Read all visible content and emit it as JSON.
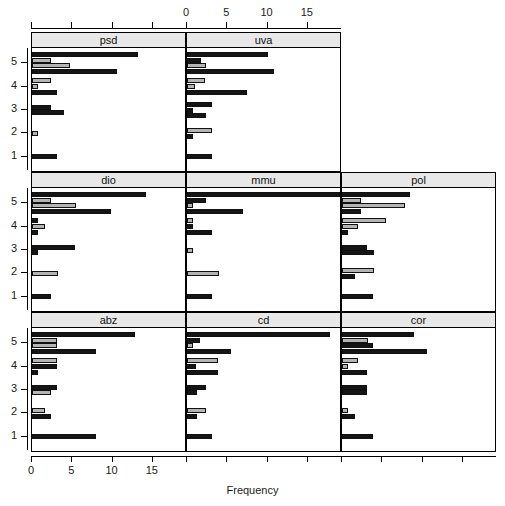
{
  "chart_data": {
    "type": "bar",
    "orientation": "horizontal",
    "title": "",
    "xlabel": "Frequency",
    "ylabel": "",
    "xlim": [
      0,
      19
    ],
    "ylim": [
      0.4,
      5.6
    ],
    "xticks": [
      0,
      5,
      10,
      15
    ],
    "yticks": [
      1,
      2,
      3,
      4,
      5
    ],
    "xtick_labels": [
      "0",
      "5",
      "10",
      "15"
    ],
    "ytick_labels": [
      "1",
      "2",
      "3",
      "4",
      "5"
    ],
    "grid": false,
    "legend": "none",
    "axis_top": true,
    "axis_bottom": true,
    "layout": {
      "rows": 3,
      "cols": 3,
      "panel_order": "by-row"
    },
    "series": [
      {
        "name": "group-a",
        "color": "#151515",
        "style": "dark"
      },
      {
        "name": "group-b",
        "color": "#b4b4b4",
        "style": "light"
      }
    ],
    "panels": [
      {
        "label": "psd",
        "row": 0,
        "col": 0,
        "categories": [
          "1",
          "2",
          "3",
          "4",
          "5"
        ],
        "groups": [
          {
            "category": "5",
            "bars": [
              {
                "series": "group-a",
                "value": 13.2
              },
              {
                "series": "group-b",
                "value": 2.4
              },
              {
                "series": "group-b",
                "value": 4.7
              },
              {
                "series": "group-a",
                "value": 10.5
              }
            ]
          },
          {
            "category": "4",
            "bars": [
              {
                "series": "group-b",
                "value": 2.4
              },
              {
                "series": "group-b",
                "value": 0.8
              },
              {
                "series": "group-a",
                "value": 3.1
              }
            ]
          },
          {
            "category": "3",
            "bars": [
              {
                "series": "group-a",
                "value": 2.3
              },
              {
                "series": "group-a",
                "value": 4.0
              }
            ]
          },
          {
            "category": "2",
            "bars": [
              {
                "series": "group-b",
                "value": 0.7
              }
            ]
          },
          {
            "category": "1",
            "bars": [
              {
                "series": "group-a",
                "value": 3.1
              }
            ]
          }
        ]
      },
      {
        "label": "uva",
        "row": 0,
        "col": 1,
        "categories": [
          "1",
          "2",
          "3",
          "4",
          "5"
        ],
        "groups": [
          {
            "category": "5",
            "bars": [
              {
                "series": "group-a",
                "value": 10.0
              },
              {
                "series": "group-a",
                "value": 1.8
              },
              {
                "series": "group-b",
                "value": 2.3
              },
              {
                "series": "group-a",
                "value": 10.8
              }
            ]
          },
          {
            "category": "4",
            "bars": [
              {
                "series": "group-b",
                "value": 2.2
              },
              {
                "series": "group-b",
                "value": 1.0
              },
              {
                "series": "group-a",
                "value": 7.5
              }
            ]
          },
          {
            "category": "3",
            "bars": [
              {
                "series": "group-a",
                "value": 3.1
              },
              {
                "series": "group-a",
                "value": 0.8
              },
              {
                "series": "group-a",
                "value": 2.3
              }
            ]
          },
          {
            "category": "2",
            "bars": [
              {
                "series": "group-b",
                "value": 3.1
              },
              {
                "series": "group-a",
                "value": 0.8
              }
            ]
          },
          {
            "category": "1",
            "bars": [
              {
                "series": "group-a",
                "value": 3.1
              }
            ]
          }
        ]
      },
      {
        "label": "dio",
        "row": 1,
        "col": 0,
        "categories": [
          "1",
          "2",
          "3",
          "4",
          "5"
        ],
        "groups": [
          {
            "category": "5",
            "bars": [
              {
                "series": "group-a",
                "value": 14.2
              },
              {
                "series": "group-b",
                "value": 2.3
              },
              {
                "series": "group-b",
                "value": 5.5
              },
              {
                "series": "group-a",
                "value": 9.8
              }
            ]
          },
          {
            "category": "4",
            "bars": [
              {
                "series": "group-a",
                "value": 0.8
              },
              {
                "series": "group-b",
                "value": 1.6
              },
              {
                "series": "group-a",
                "value": 0.8
              }
            ]
          },
          {
            "category": "3",
            "bars": [
              {
                "series": "group-a",
                "value": 5.4
              },
              {
                "series": "group-a",
                "value": 0.8
              }
            ]
          },
          {
            "category": "2",
            "bars": [
              {
                "series": "group-b",
                "value": 3.2
              }
            ]
          },
          {
            "category": "1",
            "bars": [
              {
                "series": "group-a",
                "value": 2.3
              }
            ]
          }
        ]
      },
      {
        "label": "mmu",
        "row": 1,
        "col": 1,
        "categories": [
          "1",
          "2",
          "3",
          "4",
          "5"
        ],
        "groups": [
          {
            "category": "5",
            "bars": [
              {
                "series": "group-a",
                "value": 19.0
              },
              {
                "series": "group-a",
                "value": 2.3
              },
              {
                "series": "group-b",
                "value": 0.8
              },
              {
                "series": "group-a",
                "value": 7.0
              }
            ]
          },
          {
            "category": "4",
            "bars": [
              {
                "series": "group-b",
                "value": 0.8
              },
              {
                "series": "group-a",
                "value": 0.8
              },
              {
                "series": "group-a",
                "value": 3.1
              }
            ]
          },
          {
            "category": "3",
            "bars": [
              {
                "series": "group-b",
                "value": 0.8
              }
            ]
          },
          {
            "category": "2",
            "bars": [
              {
                "series": "group-b",
                "value": 4.0
              }
            ]
          },
          {
            "category": "1",
            "bars": [
              {
                "series": "group-a",
                "value": 3.1
              }
            ]
          }
        ]
      },
      {
        "label": "pol",
        "row": 1,
        "col": 2,
        "categories": [
          "1",
          "2",
          "3",
          "4",
          "5"
        ],
        "groups": [
          {
            "category": "5",
            "bars": [
              {
                "series": "group-a",
                "value": 8.5
              },
              {
                "series": "group-b",
                "value": 2.4
              },
              {
                "series": "group-b",
                "value": 7.8
              },
              {
                "series": "group-a",
                "value": 2.4
              }
            ]
          },
          {
            "category": "4",
            "bars": [
              {
                "series": "group-b",
                "value": 5.5
              },
              {
                "series": "group-b",
                "value": 2.0
              },
              {
                "series": "group-a",
                "value": 0.8
              }
            ]
          },
          {
            "category": "3",
            "bars": [
              {
                "series": "group-a",
                "value": 3.1
              },
              {
                "series": "group-a",
                "value": 4.0
              }
            ]
          },
          {
            "category": "2",
            "bars": [
              {
                "series": "group-b",
                "value": 4.0
              },
              {
                "series": "group-a",
                "value": 1.6
              }
            ]
          },
          {
            "category": "1",
            "bars": [
              {
                "series": "group-a",
                "value": 3.9
              }
            ]
          }
        ]
      },
      {
        "label": "abz",
        "row": 2,
        "col": 0,
        "categories": [
          "1",
          "2",
          "3",
          "4",
          "5"
        ],
        "groups": [
          {
            "category": "5",
            "bars": [
              {
                "series": "group-a",
                "value": 12.8
              },
              {
                "series": "group-b",
                "value": 3.1
              },
              {
                "series": "group-b",
                "value": 3.1
              },
              {
                "series": "group-a",
                "value": 8.0
              }
            ]
          },
          {
            "category": "4",
            "bars": [
              {
                "series": "group-b",
                "value": 3.1
              },
              {
                "series": "group-a",
                "value": 3.1
              },
              {
                "series": "group-a",
                "value": 0.8
              }
            ]
          },
          {
            "category": "3",
            "bars": [
              {
                "series": "group-a",
                "value": 3.1
              },
              {
                "series": "group-b",
                "value": 2.3
              }
            ]
          },
          {
            "category": "2",
            "bars": [
              {
                "series": "group-b",
                "value": 1.6
              },
              {
                "series": "group-a",
                "value": 2.3
              }
            ]
          },
          {
            "category": "1",
            "bars": [
              {
                "series": "group-a",
                "value": 8.0
              }
            ]
          }
        ]
      },
      {
        "label": "cd",
        "row": 2,
        "col": 1,
        "categories": [
          "1",
          "2",
          "3",
          "4",
          "5"
        ],
        "groups": [
          {
            "category": "5",
            "bars": [
              {
                "series": "group-a",
                "value": 17.8
              },
              {
                "series": "group-a",
                "value": 1.6
              },
              {
                "series": "group-b",
                "value": 0.8
              },
              {
                "series": "group-a",
                "value": 5.5
              }
            ]
          },
          {
            "category": "4",
            "bars": [
              {
                "series": "group-b",
                "value": 3.9
              },
              {
                "series": "group-a",
                "value": 1.1
              },
              {
                "series": "group-a",
                "value": 3.9
              }
            ]
          },
          {
            "category": "3",
            "bars": [
              {
                "series": "group-a",
                "value": 2.3
              },
              {
                "series": "group-a",
                "value": 1.2
              }
            ]
          },
          {
            "category": "2",
            "bars": [
              {
                "series": "group-b",
                "value": 2.3
              },
              {
                "series": "group-a",
                "value": 1.2
              }
            ]
          },
          {
            "category": "1",
            "bars": [
              {
                "series": "group-a",
                "value": 3.1
              }
            ]
          }
        ]
      },
      {
        "label": "cor",
        "row": 2,
        "col": 2,
        "categories": [
          "1",
          "2",
          "3",
          "4",
          "5"
        ],
        "groups": [
          {
            "category": "5",
            "bars": [
              {
                "series": "group-a",
                "value": 9.0
              },
              {
                "series": "group-b",
                "value": 3.2
              },
              {
                "series": "group-a",
                "value": 3.9
              },
              {
                "series": "group-a",
                "value": 10.5
              }
            ]
          },
          {
            "category": "4",
            "bars": [
              {
                "series": "group-b",
                "value": 2.0
              },
              {
                "series": "group-b",
                "value": 0.8
              },
              {
                "series": "group-a",
                "value": 3.1
              }
            ]
          },
          {
            "category": "3",
            "bars": [
              {
                "series": "group-a",
                "value": 3.1
              },
              {
                "series": "group-a",
                "value": 3.1
              }
            ]
          },
          {
            "category": "2",
            "bars": [
              {
                "series": "group-b",
                "value": 0.8
              },
              {
                "series": "group-a",
                "value": 1.6
              }
            ]
          },
          {
            "category": "1",
            "bars": [
              {
                "series": "group-a",
                "value": 3.9
              }
            ]
          }
        ]
      }
    ]
  }
}
